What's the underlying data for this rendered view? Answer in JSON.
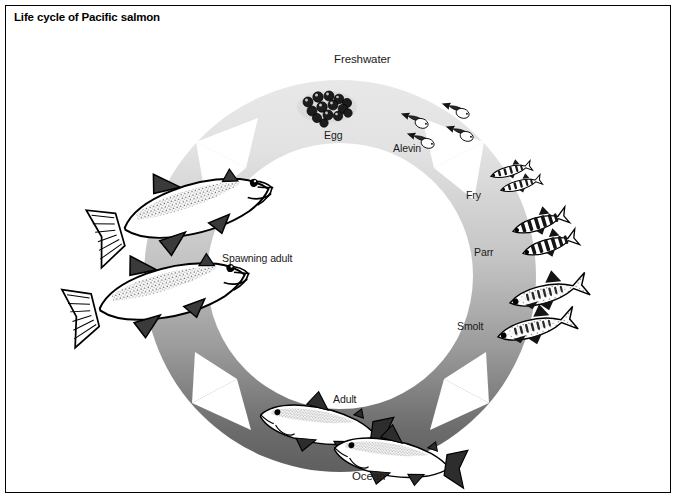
{
  "figure": {
    "title": "Life cycle of Pacific salmon",
    "frame_color": "#000000",
    "background": "#ffffff"
  },
  "diagram": {
    "type": "cycle-ring",
    "direction": "clockwise",
    "center": {
      "x": 340,
      "y": 276
    },
    "outer_radius": 196,
    "inner_radius": 133,
    "environments": [
      {
        "name": "Freshwater",
        "label": "Freshwater",
        "x": 366,
        "y": 62,
        "ring_color": "#e9e9e9",
        "span_deg": [
          200,
          360
        ]
      },
      {
        "name": "Ocean",
        "label": "Ocean",
        "x": 383,
        "y": 481,
        "ring_color": "#585858",
        "span_deg": [
          20,
          160
        ]
      }
    ],
    "gradient_stops": [
      {
        "at": "top",
        "hex": "#ececec"
      },
      {
        "at": "right",
        "hex": "#d2d2d2"
      },
      {
        "at": "bottom",
        "hex": "#585858"
      },
      {
        "at": "left",
        "hex": "#b4b4b4"
      }
    ],
    "arrow_notches": [
      {
        "name": "notch-upper-left",
        "angle_deg": 215
      },
      {
        "name": "notch-upper-right",
        "angle_deg": 325
      },
      {
        "name": "notch-lower-right",
        "angle_deg": 35
      },
      {
        "name": "notch-lower-left",
        "angle_deg": 145
      }
    ],
    "stages": [
      {
        "id": "egg",
        "label": "Egg",
        "label_x": 330,
        "label_y": 136,
        "count": 1,
        "kind": "egg-cluster",
        "angle_deg": 255
      },
      {
        "id": "alevin",
        "label": "Alevin",
        "label_x": 400,
        "label_y": 149,
        "count": 4,
        "kind": "alevin",
        "angle_deg": 285
      },
      {
        "id": "fry",
        "label": "Fry",
        "label_x": 469,
        "label_y": 196,
        "count": 2,
        "kind": "fry",
        "angle_deg": 312
      },
      {
        "id": "parr",
        "label": "Parr",
        "label_x": 481,
        "label_y": 253,
        "count": 2,
        "kind": "parr",
        "angle_deg": 338
      },
      {
        "id": "smolt",
        "label": "Smolt",
        "label_x": 463,
        "label_y": 327,
        "count": 2,
        "kind": "smolt",
        "angle_deg": 5
      },
      {
        "id": "adult",
        "label": "Adult",
        "label_x": 337,
        "label_y": 399,
        "count": 2,
        "kind": "adult",
        "angle_deg": 80
      },
      {
        "id": "spawning-adult",
        "label": "Spawning adult",
        "label_x": 226,
        "label_y": 258,
        "count": 2,
        "kind": "spawning",
        "angle_deg": 175
      }
    ]
  }
}
